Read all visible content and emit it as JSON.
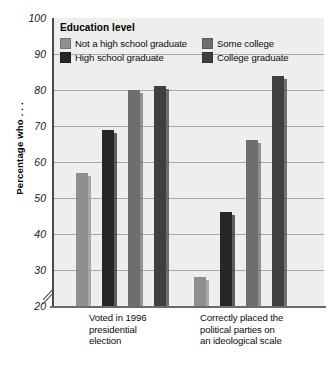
{
  "chart_data": {
    "type": "bar",
    "title": "",
    "subtitle": "",
    "xlabel": "",
    "ylabel": "Percentage who . . .",
    "ylim": [
      20,
      100
    ],
    "yticks": [
      20,
      30,
      40,
      50,
      60,
      70,
      80,
      90,
      100
    ],
    "axis_break": true,
    "grid": true,
    "legend_title": "Education level",
    "legend_position": "inside-top-left",
    "categories": [
      "Voted in 1996 presidential election",
      "Correctly placed the political parties on an ideological scale"
    ],
    "series": [
      {
        "name": "Not a high school graduate",
        "color": "#8f8f8f",
        "values": [
          57,
          28
        ]
      },
      {
        "name": "High school graduate",
        "color": "#262626",
        "values": [
          69,
          46
        ]
      },
      {
        "name": "Some college",
        "color": "#6e6e6e",
        "values": [
          80,
          66
        ]
      },
      {
        "name": "College graduate",
        "color": "#3f3f3f",
        "values": [
          81,
          84
        ]
      }
    ]
  },
  "axis": {
    "y_title": "Percentage who . . .",
    "ticks": [
      "100",
      "90",
      "80",
      "70",
      "60",
      "50",
      "40",
      "30",
      "20"
    ]
  },
  "legend": {
    "title": "Education level",
    "items": [
      {
        "label": "Not a high school graduate",
        "color": "#8f8f8f"
      },
      {
        "label": "Some college",
        "color": "#6e6e6e"
      },
      {
        "label": "High school graduate",
        "color": "#262626"
      },
      {
        "label": "College graduate",
        "color": "#3f3f3f"
      }
    ]
  },
  "categories": [
    {
      "lines": [
        "Voted in 1996",
        "presidential",
        "election"
      ]
    },
    {
      "lines": [
        "Correctly placed the",
        "political parties on",
        "an ideological scale"
      ]
    }
  ]
}
